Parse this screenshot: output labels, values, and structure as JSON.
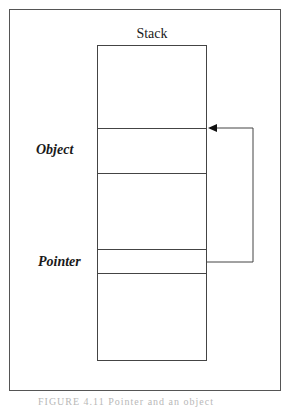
{
  "diagram": {
    "title": "Stack",
    "labels": {
      "object": "Object",
      "pointer": "Pointer"
    },
    "stack_cells": [
      {
        "name": "top-free",
        "y_top": 0,
        "y_bottom": 83
      },
      {
        "name": "object-cell",
        "y_top": 83,
        "y_bottom": 128
      },
      {
        "name": "middle-free",
        "y_top": 128,
        "y_bottom": 204
      },
      {
        "name": "pointer-cell",
        "y_top": 204,
        "y_bottom": 228
      },
      {
        "name": "bottom-free",
        "y_top": 228,
        "y_bottom": 316
      }
    ],
    "connector": {
      "from": "Pointer",
      "to": "Object",
      "arrowhead": "filled-triangle-left"
    },
    "caption": "FIGURE 4.11  Pointer and an object"
  }
}
